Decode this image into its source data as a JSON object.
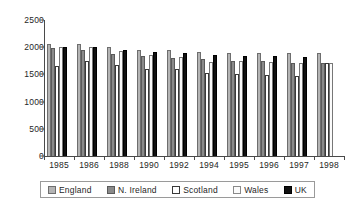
{
  "chart_data": {
    "type": "bar",
    "title": "",
    "subtitle": "",
    "xlabel": "",
    "ylabel": "",
    "ylim": [
      0,
      2500
    ],
    "ytick_values": [
      0,
      500,
      1000,
      1500,
      2000,
      2500
    ],
    "ytick_labels": [
      "0",
      "500",
      "1000",
      "1500",
      "2000",
      "2500"
    ],
    "grid": false,
    "legend_position": "bottom",
    "categories": [
      "1985",
      "1986",
      "1988",
      "1990",
      "1992",
      "1994",
      "1995",
      "1996",
      "1997",
      "1998"
    ],
    "series": [
      {
        "name": "England",
        "color": "#b4b4b4",
        "values": [
          2060,
          2050,
          2010,
          1955,
          1940,
          1920,
          1895,
          1900,
          1895,
          1885
        ]
      },
      {
        "name": "N. Ireland",
        "color": "#8a8a8a",
        "values": [
          1990,
          1955,
          1875,
          1840,
          1800,
          1790,
          1750,
          1740,
          1705,
          1705
        ]
      },
      {
        "name": "Scotland",
        "color": "#ffffff",
        "values": [
          1660,
          1740,
          1670,
          1595,
          1600,
          1525,
          1510,
          1495,
          1465,
          1715
        ]
      },
      {
        "name": "Wales",
        "color": "#fbfbfb",
        "values": [
          2010,
          1995,
          1930,
          1855,
          1825,
          1735,
          1740,
          1735,
          1715,
          1715
        ]
      },
      {
        "name": "UK",
        "color": "#111111",
        "values": [
          2010,
          1995,
          1950,
          1905,
          1885,
          1860,
          1845,
          1830,
          1815,
          null
        ]
      }
    ]
  },
  "legend": {
    "items": [
      {
        "label": "England",
        "key": "england"
      },
      {
        "label": "N. Ireland",
        "key": "nireland"
      },
      {
        "label": "Scotland",
        "key": "scotland"
      },
      {
        "label": "Wales",
        "key": "wales"
      },
      {
        "label": "UK",
        "key": "uk"
      }
    ]
  }
}
